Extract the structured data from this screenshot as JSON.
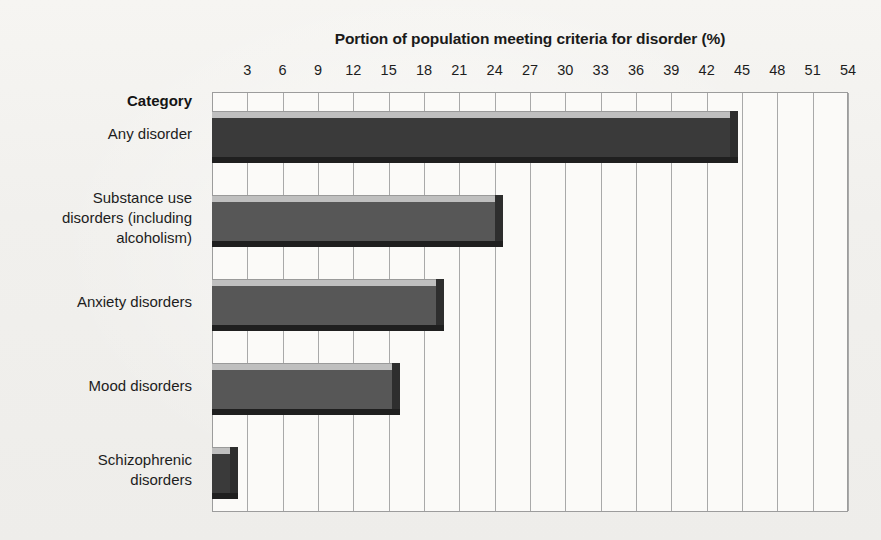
{
  "chart_data": {
    "type": "bar",
    "orientation": "horizontal",
    "title": "Portion of population meeting criteria for disorder (%)",
    "xlabel": "Portion of population meeting criteria for disorder (%)",
    "ylabel": "Category",
    "xlim": [
      0,
      54
    ],
    "grid": true,
    "legend": "none",
    "categories": [
      "Any disorder",
      "Substance use\ndisorders (including\nalcoholism)",
      "Anxiety disorders",
      "Mood disorders",
      "Schizophrenic\ndisorders"
    ],
    "values": [
      44,
      24,
      19,
      15.3,
      1.5
    ],
    "xticks": [
      3,
      6,
      9,
      12,
      15,
      18,
      21,
      24,
      27,
      30,
      33,
      36,
      39,
      42,
      45,
      48,
      51,
      54
    ],
    "xtick_labels": [
      "3",
      "6",
      "9",
      "12",
      "15",
      "18",
      "21",
      "24",
      "27",
      "30",
      "33",
      "36",
      "39",
      "42",
      "45",
      "48",
      "51",
      "54"
    ],
    "bar_colors": [
      "#3a3a3a",
      "#575757",
      "#575757",
      "#575757",
      "#3a3a3a"
    ],
    "bar_top_color": "#bfbfbf",
    "bar_side_color": "#2e2e2e"
  },
  "axis": {
    "category_header": "Category"
  },
  "colors": {
    "page_background": "#f2f1ee",
    "plot_background": "#fbfaf8",
    "gridline": "#a9a9a9",
    "frame": "#9c9c9c",
    "text": "#1d1d1d"
  }
}
